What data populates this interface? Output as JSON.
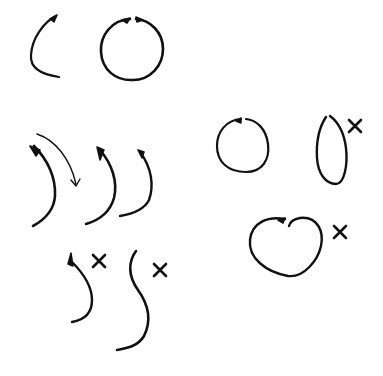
{
  "diagram": {
    "background": "#ffffff",
    "ink": "#111111",
    "groups": [
      {
        "id": "row1-left-stroke",
        "label": "single left arc stroke",
        "paths": [
          {
            "d": "M56,16 C44,22 32,38 31,55 C30,66 38,74 59,77",
            "w": 2.2
          },
          {
            "d": "M57,15 L50,19 L54,22 Z",
            "w": 0,
            "fill": true
          }
        ]
      },
      {
        "id": "row1-full-circle",
        "label": "completed circle from two strokes",
        "paths": [
          {
            "d": "M130,19 C112,20 100,35 101,52 C102,70 116,81 133,80 C150,80 163,66 163,49 C163,32 150,20 136,19",
            "w": 2.6
          },
          {
            "d": "M130,18 L122,20 L127,23 Z",
            "w": 0,
            "fill": true
          },
          {
            "d": "M136,17 L143,20 L137,22 Z",
            "w": 0,
            "fill": true
          }
        ]
      },
      {
        "id": "row2-stroke-a",
        "label": "tapered right arc with direction arrow",
        "paths": [
          {
            "d": "M34,146 C48,160 56,178 55,196 C54,210 44,220 33,226",
            "w": 2.6
          },
          {
            "d": "M30,146 L40,150 L36,156 Z",
            "w": 0,
            "fill": true
          },
          {
            "d": "M37,134 C55,140 70,158 76,184",
            "w": 1.4,
            "arrow": true
          }
        ],
        "arrow_head": {
          "d": "M71,180 L76,186 L80,179",
          "w": 1.4
        }
      },
      {
        "id": "row2-stroke-b",
        "label": "tapered right arc",
        "paths": [
          {
            "d": "M100,150 C112,164 118,182 114,198 C110,212 100,220 86,224",
            "w": 2.6
          },
          {
            "d": "M97,147 L104,150 L100,160 Z",
            "w": 0,
            "fill": true
          }
        ]
      },
      {
        "id": "row2-stroke-c",
        "label": "thin tapered right arc",
        "paths": [
          {
            "d": "M140,152 C152,168 154,186 149,200 C144,210 132,214 120,216",
            "w": 2.4
          },
          {
            "d": "M138,150 L144,152 L142,158 Z",
            "w": 0,
            "fill": true
          }
        ]
      },
      {
        "id": "row3-wrong-a",
        "label": "incorrect hooked stroke",
        "paths": [
          {
            "d": "M72,262 C80,270 92,284 92,300 C92,314 84,320 72,322",
            "w": 2.4
          },
          {
            "d": "M71,253 L73,266 L68,264 Z",
            "w": 0,
            "fill": true
          }
        ],
        "mark": {
          "type": "x-icon",
          "cx": 99,
          "cy": 261,
          "size": 6
        }
      },
      {
        "id": "row3-wrong-b",
        "label": "incorrect S-shaped stroke",
        "paths": [
          {
            "d": "M136,251 C128,262 128,276 138,290 C148,304 152,320 144,336 C138,346 128,348 117,350",
            "w": 2.6
          }
        ],
        "mark": {
          "type": "x-icon",
          "cx": 160,
          "cy": 270,
          "size": 6
        }
      },
      {
        "id": "right-circle-correct",
        "label": "correct circle",
        "paths": [
          {
            "d": "M241,119 C226,120 217,132 217,146 C217,162 228,172 246,172 C262,172 270,160 268,144 C266,128 256,120 246,119",
            "w": 2.2
          },
          {
            "d": "M241,118 L236,121 L241,123 Z",
            "w": 0,
            "fill": true
          }
        ]
      },
      {
        "id": "right-oval-wrong",
        "label": "incorrect narrow oval",
        "paths": [
          {
            "d": "M326,117 C320,126 316,140 317,158 C318,174 326,184 336,184 C344,184 348,166 346,148 C344,132 338,122 330,116",
            "w": 2.4
          }
        ],
        "mark": {
          "type": "x-icon",
          "cx": 355,
          "cy": 126,
          "size": 6
        }
      },
      {
        "id": "right-heart-wrong",
        "label": "incorrect heart-shaped loop",
        "paths": [
          {
            "d": "M285,219 C268,216 252,222 250,240 C248,258 266,272 288,276 C304,278 318,260 321,246 C324,232 318,216 300,218 C294,219 290,222 289,226",
            "w": 2.4
          },
          {
            "d": "M285,218 L278,220 L283,223 Z",
            "w": 0,
            "fill": true
          }
        ],
        "mark": {
          "type": "x-icon",
          "cx": 340,
          "cy": 232,
          "size": 6
        }
      }
    ]
  }
}
